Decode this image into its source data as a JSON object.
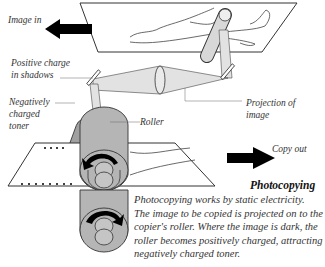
{
  "labels": {
    "image_in": "Image in",
    "positive_charge": [
      "Positive charge",
      "in shadows"
    ],
    "negative_toner": [
      "Negatively",
      "charged",
      "toner"
    ],
    "roller": "Roller",
    "projection": [
      "Projection of",
      "image"
    ],
    "copy_out": "Copy out"
  },
  "title": "Photocopying",
  "caption": [
    "Photocopying works by static electricity.",
    "The image to be copied is projected on to the",
    "copier's roller. Where the image is dark, the",
    "roller becomes positively charged, attracting",
    "negatively charged toner."
  ],
  "colors": {
    "roller_fill": "#b5b5b5",
    "beam_fill": "#e2e2e2",
    "arrow": "#000000",
    "outline": "#333333"
  }
}
